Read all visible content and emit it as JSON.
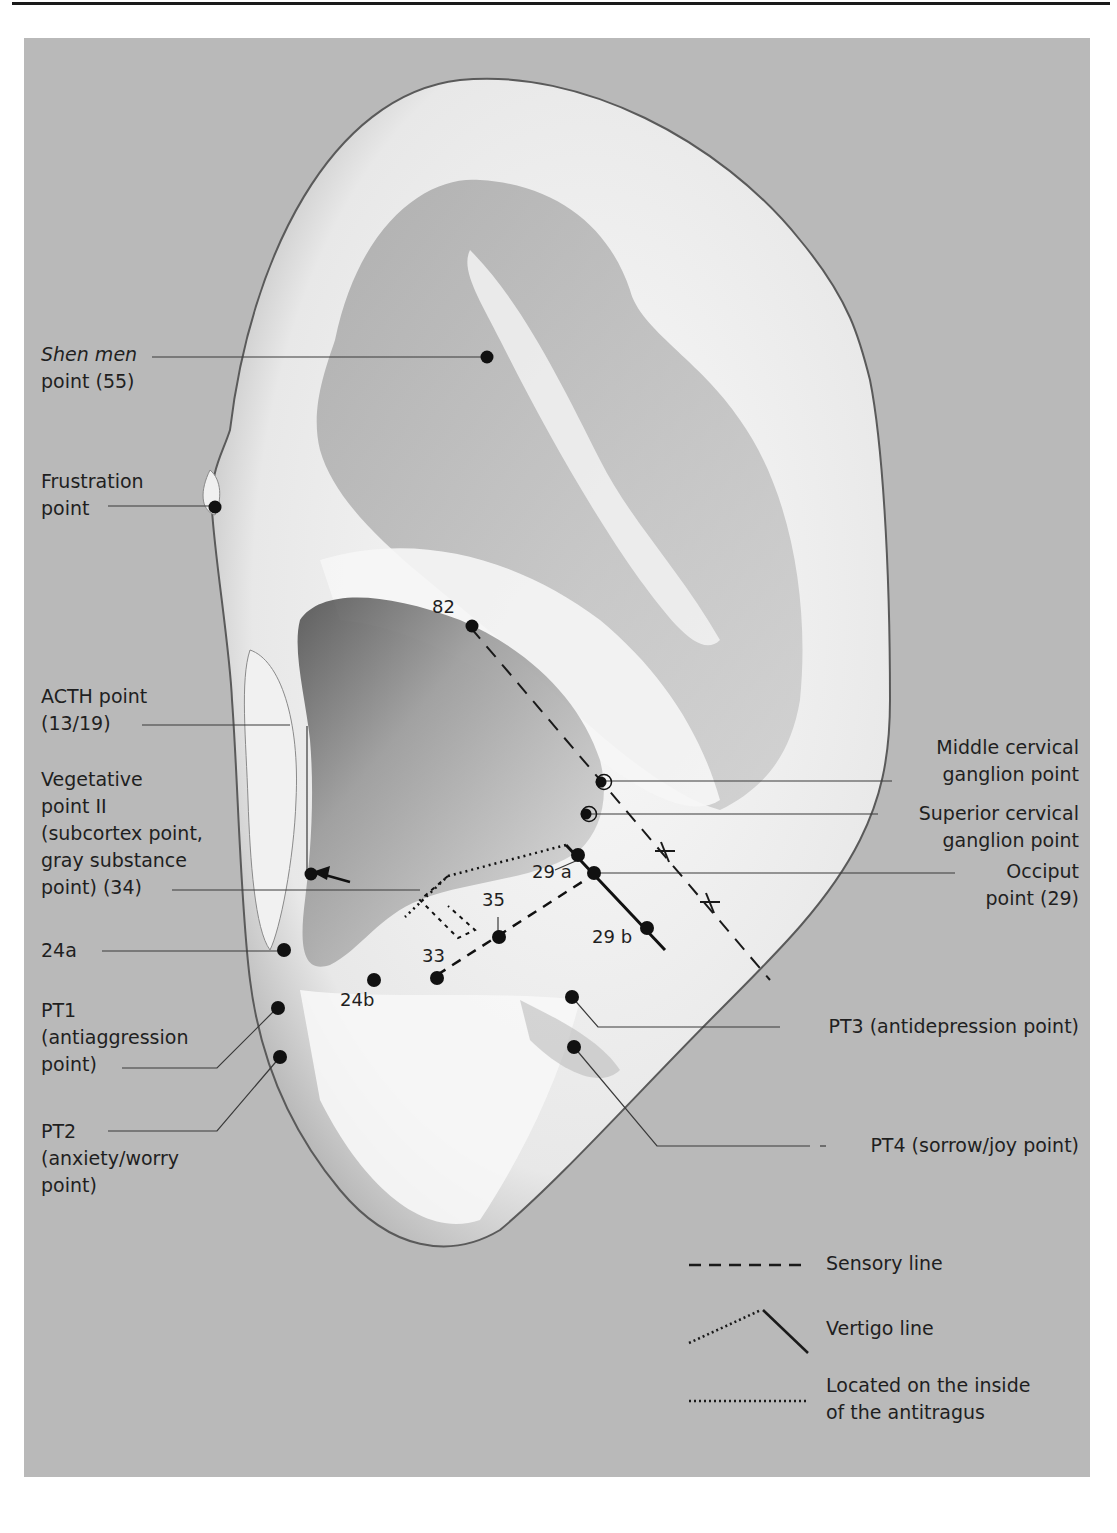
{
  "figure": {
    "background_color": "#b9b9b9",
    "ear_color": "#f4f4f4",
    "point_color": "#111111"
  },
  "labels": {
    "shen_men": {
      "line1_italic": "Shen men",
      "line2": "point (55)"
    },
    "frustration": {
      "line1": "Frustration",
      "line2": "point"
    },
    "acth": {
      "line1": "ACTH point",
      "line2": "(13/19)"
    },
    "vegetative": {
      "line1": "Vegetative",
      "line2": "point II",
      "line3": "(subcortex point,",
      "line4": "gray substance",
      "line5": "point) (34)"
    },
    "p24a": "24a",
    "pt1": {
      "line1": "PT1",
      "line2": "(antiaggression",
      "line3": "point)"
    },
    "pt2": {
      "line1": "PT2",
      "line2": "(anxiety/worry",
      "line3": "point)"
    },
    "middle_cervical": {
      "line1": "Middle cervical",
      "line2": "ganglion point"
    },
    "superior_cervical": {
      "line1": "Superior cervical",
      "line2": "ganglion point"
    },
    "occiput": {
      "line1": "Occiput",
      "line2": "point (29)"
    },
    "pt3": "PT3 (antidepression point)",
    "pt4": "PT4 (sorrow/joy point)"
  },
  "point_numbers": {
    "p82": "82",
    "p29a": "29 a",
    "p35": "35",
    "p29b": "29 b",
    "p33": "33",
    "p24b": "24b"
  },
  "legend": {
    "sensory": "Sensory line",
    "vertigo": "Vertigo line",
    "inside_line1": "Located on the inside",
    "inside_line2": "of the antitragus"
  }
}
